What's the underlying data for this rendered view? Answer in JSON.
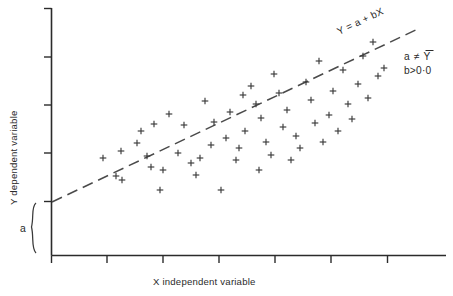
{
  "figure": {
    "background_color": "#ffffff",
    "ink_color": "#2b2b2b"
  },
  "axes": {
    "x_label": "X   independent variable",
    "y_label": "Y   dependent variable",
    "x_tick_count": 7,
    "y_tick_count": 5
  },
  "annotations": {
    "line_label": "Y = a + bX",
    "condition_line_1": "a ≠ Y",
    "condition_line_1_plain": "a ≠ Ybar",
    "condition_line_2": "b>0·0",
    "intercept_label": "a"
  },
  "chart_data": {
    "type": "scatter",
    "title": "",
    "xlabel": "X   independent variable",
    "ylabel": "Y   dependent variable",
    "xlim": [
      0,
      100
    ],
    "ylim": [
      0,
      100
    ],
    "grid": false,
    "legend": "none",
    "marker": "plus",
    "regression_line": {
      "label": "Y = a + bX",
      "style": "dashed",
      "intercept_px_y": 202,
      "x_start_px": 52,
      "y_start_px": 202,
      "x_end_px": 420,
      "y_end_px": 28,
      "slope_positive": true
    },
    "intercept_brace": {
      "label": "a",
      "top_px_y": 202,
      "bottom_px_y": 255
    },
    "points_px": [
      [
        103,
        158
      ],
      [
        121,
        151
      ],
      [
        116,
        176
      ],
      [
        122,
        180
      ],
      [
        137,
        143
      ],
      [
        141,
        131
      ],
      [
        154,
        124
      ],
      [
        151,
        167
      ],
      [
        147,
        156
      ],
      [
        160,
        190
      ],
      [
        163,
        170
      ],
      [
        169,
        114
      ],
      [
        178,
        153
      ],
      [
        184,
        125
      ],
      [
        191,
        163
      ],
      [
        196,
        175
      ],
      [
        200,
        158
      ],
      [
        205,
        101
      ],
      [
        211,
        145
      ],
      [
        214,
        122
      ],
      [
        221,
        190
      ],
      [
        226,
        138
      ],
      [
        230,
        112
      ],
      [
        236,
        160
      ],
      [
        239,
        148
      ],
      [
        243,
        95
      ],
      [
        245,
        131
      ],
      [
        251,
        86
      ],
      [
        256,
        104
      ],
      [
        259,
        170
      ],
      [
        261,
        118
      ],
      [
        266,
        142
      ],
      [
        271,
        155
      ],
      [
        274,
        74
      ],
      [
        279,
        93
      ],
      [
        283,
        127
      ],
      [
        287,
        110
      ],
      [
        291,
        160
      ],
      [
        296,
        136
      ],
      [
        300,
        148
      ],
      [
        306,
        82
      ],
      [
        311,
        100
      ],
      [
        315,
        123
      ],
      [
        319,
        61
      ],
      [
        323,
        142
      ],
      [
        329,
        115
      ],
      [
        333,
        91
      ],
      [
        338,
        131
      ],
      [
        343,
        70
      ],
      [
        348,
        104
      ],
      [
        352,
        119
      ],
      [
        358,
        84
      ],
      [
        363,
        56
      ],
      [
        368,
        98
      ],
      [
        373,
        42
      ],
      [
        378,
        76
      ],
      [
        384,
        68
      ]
    ]
  }
}
